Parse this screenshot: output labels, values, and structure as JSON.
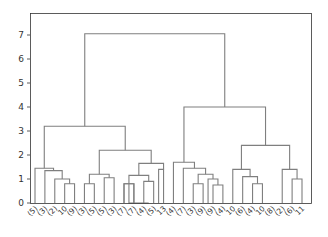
{
  "chart_data": {
    "type": "dendrogram",
    "title": "",
    "xlabel": "",
    "ylabel": "",
    "ylim": [
      0,
      7.4
    ],
    "yticks": [
      0,
      1,
      2,
      3,
      4,
      5,
      6,
      7
    ],
    "grid": false,
    "line_color": "#7f7f7f",
    "leaf_labels": [
      "(5)",
      "(3)",
      "(2)",
      "10",
      "(9)",
      "(3)",
      "(5)",
      "(5)",
      "(3)",
      "(7)",
      "(7)",
      "(4)",
      "(5)",
      "13",
      "(4)",
      "(7)",
      "(3)",
      "(9)",
      "(9)",
      "(4)",
      "10",
      "(6)",
      "(4)",
      "10",
      "(8)",
      "(2)",
      "(6)",
      "11",
      "(19)",
      "(2)",
      "(8)",
      "(5)",
      "(7)",
      "(9)"
    ],
    "links": [
      {
        "x": [
          0,
          0,
          1,
          1
        ],
        "h": [
          0,
          1.45,
          1.45,
          0
        ]
      },
      {
        "x": [
          2,
          2,
          3,
          3
        ],
        "h": [
          0,
          0.8,
          0.8,
          0
        ]
      },
      {
        "x": [
          4,
          4,
          5,
          5
        ],
        "h": [
          0,
          0.8,
          0.8,
          0
        ]
      },
      {
        "x": [
          2.5,
          2.5,
          4.5,
          4.5
        ],
        "h": [
          0.8,
          1.0,
          1.0,
          0.8
        ]
      },
      {
        "x": [
          1.5,
          1.5,
          3.5,
          3.5
        ],
        "h": [
          0,
          1.35,
          1.35,
          1.0
        ]
      },
      {
        "x": [
          0.5,
          0.5,
          2.5,
          2.5
        ],
        "h": [
          1.45,
          3.2,
          3.2,
          1.35
        ]
      }
    ],
    "merge_heights_top": [
      7.05,
      4.0,
      3.2,
      2.4,
      2.2,
      1.7,
      1.65,
      1.45
    ]
  },
  "axes": {
    "left_px": 30,
    "right_px": 311,
    "top_px": 13,
    "bottom_px": 203
  }
}
